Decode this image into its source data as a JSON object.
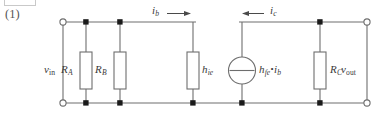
{
  "figure": {
    "number_label": "(1)",
    "caption": "",
    "type": "circuit-diagram"
  },
  "colors": {
    "wire": "#6e6e6e",
    "text": "#3a3a3a",
    "background": "#ffffff",
    "node_fill": "#1a1a1a",
    "terminal_fill": "#ffffff",
    "box_border": "#c9c9c9"
  },
  "labels": {
    "v_in": {
      "base": "v",
      "sub": "in",
      "sub_style": "upright"
    },
    "v_out": {
      "base": "v",
      "sub": "out",
      "sub_style": "upright"
    },
    "i_b": {
      "base": "i",
      "sub": "b",
      "sub_style": "italic"
    },
    "i_c": {
      "base": "i",
      "sub": "c",
      "sub_style": "italic"
    },
    "R_A": {
      "base": "R",
      "sub": "A",
      "sub_style": "italic"
    },
    "R_B": {
      "base": "R",
      "sub": "B",
      "sub_style": "italic"
    },
    "R_C": {
      "base": "R",
      "sub": "C",
      "sub_style": "italic"
    },
    "h_ie": {
      "base": "h",
      "sub": "ie",
      "sub_style": "italic"
    },
    "source": {
      "base": "h",
      "sub": "fe",
      "operator": "•",
      "base2": "i",
      "sub2": "b"
    }
  },
  "components": [
    {
      "id": "R_A",
      "kind": "resistor",
      "label": "R_A",
      "label_side": "left",
      "x": 86
    },
    {
      "id": "R_B",
      "kind": "resistor",
      "label": "R_B",
      "label_side": "left",
      "x": 120
    },
    {
      "id": "h_ie",
      "kind": "resistor",
      "label": "h_ie",
      "label_side": "right",
      "x": 193
    },
    {
      "id": "gm",
      "kind": "current-source",
      "label": "source",
      "label_side": "right",
      "x": 242
    },
    {
      "id": "R_C",
      "kind": "resistor",
      "label": "R_C",
      "label_side": "right",
      "x": 320
    }
  ],
  "terminals": [
    {
      "id": "in-top",
      "x": 63,
      "y": 22,
      "style": "open"
    },
    {
      "id": "in-bottom",
      "x": 63,
      "y": 103,
      "style": "open"
    },
    {
      "id": "out-top",
      "x": 367,
      "y": 22,
      "style": "open"
    },
    {
      "id": "out-bottom",
      "x": 367,
      "y": 103,
      "style": "open"
    }
  ],
  "arrows": [
    {
      "id": "i_b",
      "direction": "right",
      "label": "i_b",
      "x": 150,
      "y": 17
    },
    {
      "id": "i_c",
      "direction": "left",
      "label": "i_c",
      "x": 247,
      "y": 17
    }
  ]
}
